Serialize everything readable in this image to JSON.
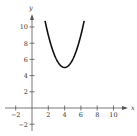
{
  "chart_data": {
    "type": "line",
    "title": "",
    "xlabel": "x",
    "ylabel": "y",
    "xlim": [
      -2.5,
      11.5
    ],
    "ylim": [
      -2.8,
      11.5
    ],
    "grid": false,
    "x_ticks": [
      -2,
      2,
      4,
      6,
      8,
      10
    ],
    "y_ticks": [
      -2,
      2,
      4,
      6,
      8,
      10
    ],
    "x_tick_labels": [
      "−2",
      "2",
      "4",
      "6",
      "8",
      "10"
    ],
    "y_tick_labels": [
      "−2",
      "2",
      "4",
      "6",
      "8",
      "10"
    ],
    "series": [
      {
        "name": "parabola",
        "equation": "y = (x - 4)^2 + 5",
        "vertex": [
          4,
          5
        ],
        "x": [
          1.6,
          2,
          2.5,
          3,
          3.5,
          4,
          4.5,
          5,
          5.5,
          6,
          6.4
        ],
        "y": [
          10.76,
          9,
          7.25,
          6,
          5.25,
          5,
          5.25,
          6,
          7.25,
          9,
          10.76
        ],
        "color": "#111111"
      }
    ]
  }
}
